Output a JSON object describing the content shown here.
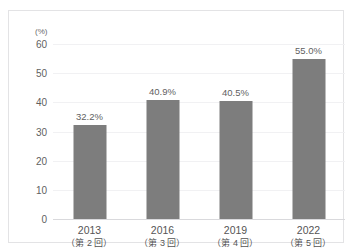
{
  "chart_data": {
    "type": "bar",
    "title": "",
    "subtitle": "",
    "xlabel": "",
    "ylabel": "",
    "unit_label": "(%)",
    "categories": [
      "2013",
      "2016",
      "2019",
      "2022"
    ],
    "category_sublabels": [
      "（第 2 回）",
      "（第 3 回）",
      "（第 4 回）",
      "（第 5 回）"
    ],
    "values": [
      32.2,
      40.9,
      40.5,
      55.0
    ],
    "value_labels": [
      "32.2%",
      "40.9%",
      "40.5%",
      "55.0%"
    ],
    "ylim": [
      0,
      60
    ],
    "yticks": [
      0,
      10,
      20,
      30,
      40,
      50,
      60
    ],
    "ytick_labels": [
      "0",
      "10",
      "20",
      "30",
      "40",
      "50",
      "60"
    ],
    "grid": true,
    "legend": false,
    "legend_position": "none",
    "bar_color": "#7d7d7d",
    "gridline_color": "#f1f1f3",
    "axis_color": "#d9d9dc",
    "border_color": "#e3e3e5",
    "background_color": "#ffffff",
    "text_color": "#555555"
  }
}
